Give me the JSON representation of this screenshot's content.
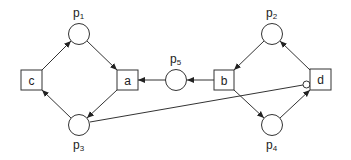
{
  "diagram": {
    "type": "petri-net",
    "places": [
      {
        "id": "p1",
        "label": "p",
        "sub": "1",
        "cx": 79,
        "cy": 34
      },
      {
        "id": "p2",
        "label": "p",
        "sub": "2",
        "cx": 272,
        "cy": 34
      },
      {
        "id": "p3",
        "label": "p",
        "sub": "3",
        "cx": 79,
        "cy": 125
      },
      {
        "id": "p4",
        "label": "p",
        "sub": "4",
        "cx": 272,
        "cy": 125
      },
      {
        "id": "p5",
        "label": "p",
        "sub": "5",
        "cx": 176,
        "cy": 80
      }
    ],
    "transitions": [
      {
        "id": "a",
        "label": "a"
      },
      {
        "id": "b",
        "label": "b"
      },
      {
        "id": "c",
        "label": "c"
      },
      {
        "id": "d",
        "label": "d"
      }
    ],
    "arcs": [
      {
        "from": "c",
        "to": "p1"
      },
      {
        "from": "p1",
        "to": "a"
      },
      {
        "from": "a",
        "to": "p3"
      },
      {
        "from": "p3",
        "to": "c"
      },
      {
        "from": "p5",
        "to": "a"
      },
      {
        "from": "b",
        "to": "p5"
      },
      {
        "from": "p2",
        "to": "b"
      },
      {
        "from": "b",
        "to": "p4"
      },
      {
        "from": "p4",
        "to": "d"
      },
      {
        "from": "d",
        "to": "p2"
      },
      {
        "from": "p3",
        "to": "d",
        "kind": "inhibitor"
      }
    ]
  }
}
